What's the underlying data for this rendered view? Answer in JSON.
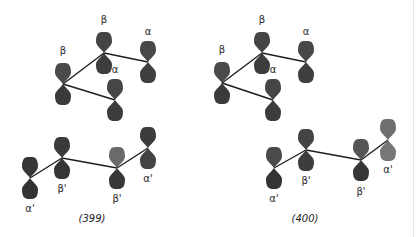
{
  "figures": [
    {
      "id": "399",
      "caption": "(399)",
      "caption_pos": [
        92,
        220
      ],
      "groups": [
        {
          "name": "upper-fragment",
          "atoms": [
            {
              "label": "β",
              "x": 63,
              "y": 84,
              "label_dy": -30,
              "upper": "#4a4a4a",
              "lower": "#3a3a3a"
            },
            {
              "label": "β",
              "x": 104,
              "y": 53,
              "label_dy": -30,
              "upper": "#444444",
              "lower": "#3d3d3d"
            },
            {
              "label": "α",
              "x": 148,
              "y": 62,
              "label_dy": -27,
              "upper": "#484848",
              "lower": "#3f3f3f"
            },
            {
              "label": "α",
              "x": 115,
              "y": 100,
              "label_dy": -27,
              "upper": "#464646",
              "lower": "#3c3c3c"
            }
          ],
          "bonds": [
            [
              0,
              1
            ],
            [
              1,
              2
            ],
            [
              0,
              3
            ]
          ]
        },
        {
          "name": "lower-fragment",
          "atoms": [
            {
              "label": "α'",
              "x": 30,
              "y": 178,
              "label_dy": 28,
              "upper": "#363636",
              "lower": "#333333"
            },
            {
              "label": "β'",
              "x": 62,
              "y": 158,
              "label_dy": 28,
              "upper": "#3a3a3a",
              "lower": "#353535"
            },
            {
              "label": "β'",
              "x": 117,
              "y": 168,
              "label_dy": 28,
              "upper": "#6a6a6a",
              "lower": "#383838"
            },
            {
              "label": "α'",
              "x": 148,
              "y": 148,
              "label_dy": 28,
              "upper": "#3c3c3c",
              "lower": "#444444"
            }
          ],
          "bonds": [
            [
              0,
              1
            ],
            [
              1,
              2
            ],
            [
              2,
              3
            ]
          ]
        }
      ]
    },
    {
      "id": "400",
      "caption": "(400)",
      "caption_pos": [
        305,
        220
      ],
      "groups": [
        {
          "name": "upper-fragment",
          "atoms": [
            {
              "label": "β",
              "x": 222,
              "y": 83,
              "label_dy": -30,
              "upper": "#4a4a4a",
              "lower": "#3a3a3a"
            },
            {
              "label": "β",
              "x": 262,
              "y": 53,
              "label_dy": -30,
              "upper": "#444444",
              "lower": "#3d3d3d"
            },
            {
              "label": "α",
              "x": 306,
              "y": 62,
              "label_dy": -27,
              "upper": "#484848",
              "lower": "#3f3f3f"
            },
            {
              "label": "α",
              "x": 273,
              "y": 100,
              "label_dy": -27,
              "upper": "#464646",
              "lower": "#3c3c3c"
            }
          ],
          "bonds": [
            [
              0,
              1
            ],
            [
              1,
              2
            ],
            [
              0,
              3
            ]
          ]
        },
        {
          "name": "lower-fragment",
          "atoms": [
            {
              "label": "α'",
              "x": 274,
              "y": 168,
              "label_dy": 28,
              "upper": "#4a4a4a",
              "lower": "#333333"
            },
            {
              "label": "β'",
              "x": 306,
              "y": 150,
              "label_dy": 28,
              "upper": "#444444",
              "lower": "#3d3d3d"
            },
            {
              "label": "β'",
              "x": 361,
              "y": 160,
              "label_dy": 29,
              "upper": "#555555",
              "lower": "#363636"
            },
            {
              "label": "α'",
              "x": 388,
              "y": 140,
              "label_dy": 27,
              "upper": "#6e6e6e",
              "lower": "#777777"
            }
          ],
          "bonds": [
            [
              0,
              1
            ],
            [
              1,
              2
            ],
            [
              2,
              3
            ]
          ]
        }
      ]
    }
  ],
  "style": {
    "lobe_width": 16,
    "lobe_height": 21,
    "background": "#ffffff",
    "bond_color": "#1e1e1e"
  }
}
